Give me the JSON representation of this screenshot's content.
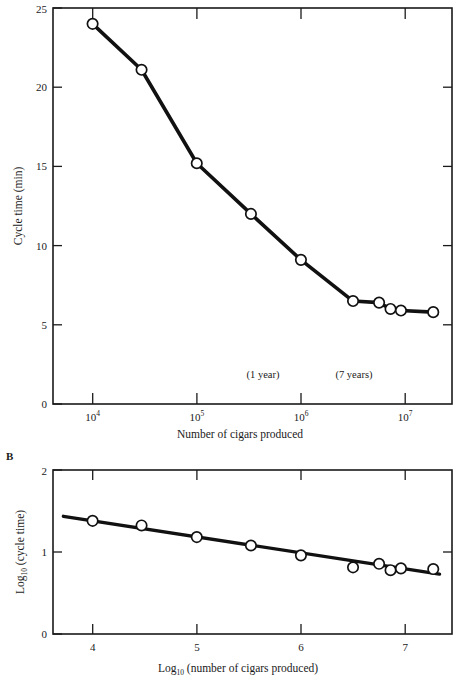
{
  "figure": {
    "panel_a_letter": "",
    "panel_b_letter": "B"
  },
  "chart_data": [
    {
      "id": "panel_a",
      "type": "line",
      "title": "",
      "xlabel": "Number of cigars produced",
      "ylabel": "Cycle time (min)",
      "x_scale": "log10",
      "xlim": [
        3.62,
        7.45
      ],
      "ylim": [
        0,
        25
      ],
      "grid": false,
      "legend": "none",
      "x_ticks": [
        {
          "value": 4,
          "label_base": "10",
          "label_exp": "4"
        },
        {
          "value": 5,
          "label_base": "10",
          "label_exp": "5"
        },
        {
          "value": 6,
          "label_base": "10",
          "label_exp": "6"
        },
        {
          "value": 7,
          "label_base": "10",
          "label_exp": "7"
        }
      ],
      "y_ticks": [
        0,
        5,
        10,
        15,
        20,
        25
      ],
      "points": [
        {
          "log_x": 4.0,
          "x": 10000,
          "y": 24.0
        },
        {
          "log_x": 4.47,
          "x": 29500,
          "y": 21.1
        },
        {
          "log_x": 5.0,
          "x": 100000,
          "y": 15.2
        },
        {
          "log_x": 5.52,
          "x": 331000,
          "y": 12.0
        },
        {
          "log_x": 6.0,
          "x": 1000000,
          "y": 9.1
        },
        {
          "log_x": 6.5,
          "x": 3160000,
          "y": 6.5
        },
        {
          "log_x": 6.75,
          "x": 5620000,
          "y": 6.4
        },
        {
          "log_x": 6.86,
          "x": 7240000,
          "y": 6.0
        },
        {
          "log_x": 6.96,
          "x": 9120000,
          "y": 5.9
        },
        {
          "log_x": 7.27,
          "x": 18600000,
          "y": 5.8
        }
      ],
      "annotations": [
        {
          "text": "(1 year)",
          "log_x": 6.06,
          "y": 2.05
        },
        {
          "text": "(7 years)",
          "log_x": 6.93,
          "y": 2.05
        }
      ]
    },
    {
      "id": "panel_b",
      "type": "scatter",
      "title": "",
      "xlabel_base": "Log",
      "xlabel_sub": "10",
      "xlabel_rest": "(number of cigars produced)",
      "ylabel_base": "Log",
      "ylabel_sub": "10",
      "ylabel_rest": "(cycle time)",
      "xlim": [
        3.62,
        7.45
      ],
      "ylim": [
        0,
        2
      ],
      "grid": false,
      "legend": "none",
      "x_ticks": [
        4,
        5,
        6,
        7
      ],
      "y_ticks": [
        0,
        1,
        2
      ],
      "points": [
        {
          "x": 4.0,
          "y": 1.38
        },
        {
          "x": 4.47,
          "y": 1.324
        },
        {
          "x": 5.0,
          "y": 1.182
        },
        {
          "x": 5.52,
          "y": 1.079
        },
        {
          "x": 6.0,
          "y": 0.959
        },
        {
          "x": 6.5,
          "y": 0.813
        },
        {
          "x": 6.75,
          "y": 0.856
        },
        {
          "x": 6.86,
          "y": 0.778
        },
        {
          "x": 6.96,
          "y": 0.8
        },
        {
          "x": 7.27,
          "y": 0.792
        }
      ],
      "fit_line": {
        "x_start": 3.72,
        "y_start": 1.435,
        "x_end": 7.33,
        "y_end": 0.73
      }
    }
  ]
}
